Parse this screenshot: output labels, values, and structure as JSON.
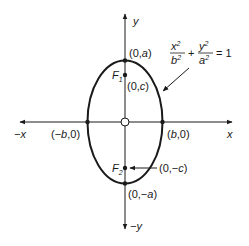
{
  "diagram": {
    "type": "ellipse-vertical-major-axis",
    "equation": {
      "x_num": "x",
      "x_exp": "2",
      "x_den": "b",
      "x_den_exp": "2",
      "plus": "+",
      "y_num": "y",
      "y_exp": "2",
      "y_den": "a",
      "y_den_exp": "2",
      "equals": "= 1"
    },
    "axes": {
      "pos_x": "x",
      "neg_x": "−x",
      "pos_y": "y",
      "neg_y": "−y"
    },
    "points": {
      "top_vertex": "(0,a)",
      "bottom_vertex": "(0,−a)",
      "focus1_coord": "(0,c)",
      "focus2_coord": "(0,−c)",
      "right_covertex": "(b,0)",
      "left_covertex": "(−b,0)",
      "origin": "O"
    },
    "foci": {
      "f1_letter": "F",
      "f1_sub": "1",
      "f2_letter": "F",
      "f2_sub": "2"
    },
    "colors": {
      "stroke": "#1a1a1a",
      "background": "#ffffff"
    }
  }
}
